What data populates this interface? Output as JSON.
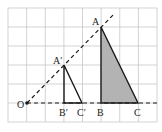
{
  "figure": {
    "grid": {
      "x0": 8,
      "y0": 8,
      "cols": 8,
      "rows": 6,
      "cell_w": 18.625,
      "cell_h": 19,
      "color": "#c8c8c8"
    },
    "colors": {
      "line": "#1a1a1a",
      "fill": "#b3b3b3"
    },
    "points": {
      "O": {
        "label": "O",
        "x": 27,
        "y": 103
      },
      "A": {
        "label": "A",
        "x": 101,
        "y": 27
      },
      "B": {
        "label": "B",
        "x": 101,
        "y": 103
      },
      "C": {
        "label": "C",
        "x": 138,
        "y": 103
      },
      "A1": {
        "label": "A′",
        "x": 64,
        "y": 65
      },
      "B1": {
        "label": "B′",
        "x": 64,
        "y": 103
      },
      "C1": {
        "label": "C′",
        "x": 82,
        "y": 103
      }
    },
    "labels": {
      "O": "O",
      "A": "A",
      "B": "B",
      "C": "C",
      "A1": "A′",
      "B1": "B′",
      "C1": "C′"
    }
  }
}
